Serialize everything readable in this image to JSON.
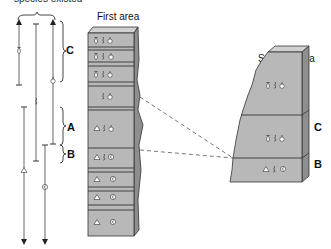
{
  "header": {
    "range_title": "species existed"
  },
  "areas": {
    "first": {
      "title": "First area"
    },
    "second": {
      "title": "Second area"
    }
  },
  "range_chart": {
    "zones": [
      {
        "label": "C"
      },
      {
        "label": "A"
      },
      {
        "label": "B"
      }
    ],
    "species": [
      "species-1",
      "species-2",
      "species-3",
      "species-4",
      "species-5"
    ]
  },
  "first_area_column": {
    "layers": [
      {
        "fossils": [
          "species-1",
          "species-2",
          "species-3"
        ],
        "zone_label": ""
      },
      {
        "fossils": [
          "species-1",
          "species-2",
          "species-3"
        ],
        "zone_label": "C"
      },
      {
        "fossils": [
          "species-1",
          "species-2",
          "species-3"
        ],
        "zone_label": ""
      },
      {
        "fossils": [
          "species-2",
          "species-3"
        ],
        "zone_label": ""
      },
      {
        "fossils": [
          "species-4",
          "species-2",
          "species-3"
        ],
        "zone_label": "A"
      },
      {
        "fossils": [
          "species-4",
          "species-2",
          "species-5"
        ],
        "zone_label": "B"
      },
      {
        "fossils": [
          "species-4",
          "species-5"
        ],
        "zone_label": ""
      },
      {
        "fossils": [
          "species-4",
          "species-5"
        ],
        "zone_label": ""
      },
      {
        "fossils": [
          "species-4",
          "species-5"
        ],
        "zone_label": ""
      }
    ]
  },
  "second_area_column": {
    "layers": [
      {
        "fossils": [
          "species-1",
          "species-2",
          "species-3"
        ]
      },
      {
        "fossils": [
          "species-1",
          "species-2",
          "species-3"
        ]
      },
      {
        "fossils": [
          "species-4",
          "species-2",
          "species-5"
        ]
      }
    ],
    "zone_labels": {
      "c": "C",
      "b": "B"
    }
  },
  "colors": {
    "rock_face": "#b8b8b8",
    "rock_top": "#d0d0d0",
    "rock_side": "#8e8e8e",
    "line": "#555555"
  }
}
